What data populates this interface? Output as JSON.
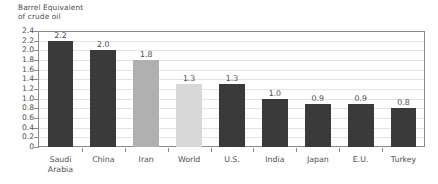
{
  "chart_data": {
    "type": "bar",
    "title": "Barrel Equivalent\nof crude oil",
    "xlabel": "",
    "ylabel": "",
    "ylim": [
      0,
      2.4
    ],
    "ytick_step": 0.2,
    "grid": true,
    "legend": "none",
    "categories": [
      "Saudi\nArabia",
      "China",
      "Iran",
      "World",
      "U.S.",
      "India",
      "Japan",
      "E.U.",
      "Turkey"
    ],
    "values": [
      2.2,
      2.0,
      1.8,
      1.3,
      1.3,
      1.0,
      0.9,
      0.9,
      0.8
    ],
    "value_labels": [
      "2.2",
      "2.0",
      "1.8",
      "1.3",
      "1.3",
      "1.0",
      "0.9",
      "0.9",
      "0.8"
    ],
    "bar_colors": [
      "#3a3a3a",
      "#3a3a3a",
      "#b0b0b0",
      "#d8d8d8",
      "#3a3a3a",
      "#3a3a3a",
      "#3a3a3a",
      "#3a3a3a",
      "#3a3a3a"
    ],
    "ytick_labels": [
      "2.4",
      "2.2",
      "2.0",
      "1.8",
      "1.6",
      "1.4",
      "1.2",
      "1.0",
      "0.8",
      "0.6",
      "0.4",
      "0.2",
      "0"
    ],
    "ytick_values": [
      2.4,
      2.2,
      2.0,
      1.8,
      1.6,
      1.4,
      1.2,
      1.0,
      0.8,
      0.6,
      0.4,
      0.2,
      0
    ]
  },
  "colors": {
    "bar_dark": "#3a3a3a",
    "bar_medium": "#b0b0b0",
    "bar_light": "#d8d8d8",
    "gridline": "#e3e3e3",
    "axis": "#8a8a8a",
    "text": "#4e4e4e",
    "background": "#ffffff"
  }
}
